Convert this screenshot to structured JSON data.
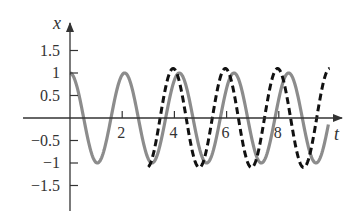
{
  "chart_data": {
    "type": "line",
    "title": "",
    "xlabel": "t",
    "ylabel": "x",
    "xlim": [
      -1.8,
      10.5
    ],
    "ylim": [
      -2.05,
      2.1
    ],
    "grid": false,
    "legend": null,
    "x_ticks": [
      {
        "value": 2,
        "label": "2"
      },
      {
        "value": 4,
        "label": "4"
      },
      {
        "value": 6,
        "label": "6"
      },
      {
        "value": 8,
        "label": "8"
      }
    ],
    "y_ticks": [
      {
        "value": 1.5,
        "label": "1.5"
      },
      {
        "value": 1,
        "label": "1"
      },
      {
        "value": 0.5,
        "label": "0.5"
      },
      {
        "value": -0.5,
        "label": "−0.5"
      },
      {
        "value": -1,
        "label": "−1"
      },
      {
        "value": -1.5,
        "label": "−1.5"
      }
    ],
    "series": [
      {
        "name": "solid-gray",
        "style": "solid",
        "color": "#8c8c8c",
        "function": "cos(3t)",
        "amplitude": 1.0,
        "angular_frequency": 3.0,
        "phase_shift": 0.0,
        "t_range": [
          0,
          9.9
        ]
      },
      {
        "name": "dashed-black",
        "style": "dashed",
        "color": "#111111",
        "function": "1.1 cos(pi t + 0.15)",
        "amplitude": 1.1,
        "angular_frequency": 3.14159,
        "phase_shift": 0.15,
        "t_range": [
          3.0,
          9.95
        ]
      }
    ]
  }
}
